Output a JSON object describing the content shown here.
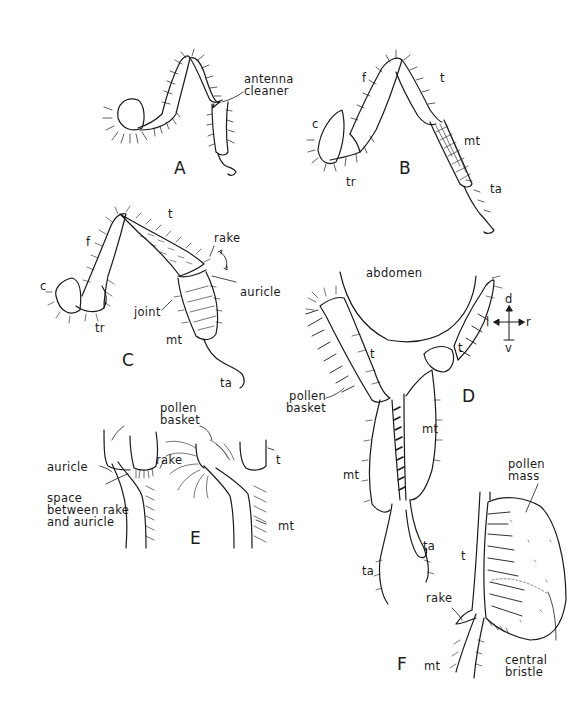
{
  "figure": {
    "panels": [
      {
        "id": "A",
        "letter": "A",
        "labels": [
          "antenna cleaner"
        ]
      },
      {
        "id": "B",
        "letter": "B",
        "labels": [
          "c",
          "f",
          "t",
          "tr",
          "mt",
          "ta"
        ]
      },
      {
        "id": "C",
        "letter": "C",
        "labels": [
          "c",
          "f",
          "t",
          "tr",
          "rake",
          "auricle",
          "joint",
          "mt",
          "ta"
        ]
      },
      {
        "id": "D",
        "letter": "D",
        "labels": [
          "abdomen",
          "t",
          "t",
          "pollen basket",
          "mt",
          "mt",
          "ta",
          "ta"
        ]
      },
      {
        "id": "E",
        "letter": "E",
        "labels": [
          "pollen basket",
          "auricle",
          "rake",
          "space between rake and auricle",
          "t",
          "mt"
        ]
      },
      {
        "id": "F",
        "letter": "F",
        "labels": [
          "pollen mass",
          "t",
          "rake",
          "central bristle",
          "mt"
        ]
      }
    ],
    "compass": {
      "up": "d",
      "down": "v",
      "left": "l",
      "right": "r"
    }
  },
  "A": {
    "letter": "A",
    "antenna_cleaner_1": "antenna",
    "antenna_cleaner_2": "cleaner"
  },
  "B": {
    "letter": "B",
    "c": "c",
    "f": "f",
    "t": "t",
    "tr": "tr",
    "mt": "mt",
    "ta": "ta"
  },
  "C": {
    "letter": "C",
    "c": "c",
    "f": "f",
    "t": "t",
    "tr": "tr",
    "rake": "rake",
    "auricle": "auricle",
    "joint": "joint",
    "mt": "mt",
    "ta": "ta"
  },
  "D": {
    "letter": "D",
    "abdomen": "abdomen",
    "t_left": "t",
    "t_right": "t",
    "pollen_basket_1": "pollen",
    "pollen_basket_2": "basket",
    "mt_right": "mt",
    "mt_left": "mt",
    "ta_right": "ta",
    "ta_left": "ta"
  },
  "E": {
    "letter": "E",
    "pollen_basket_1": "pollen",
    "pollen_basket_2": "basket",
    "auricle": "auricle",
    "rake": "rake",
    "space_1": "space",
    "space_2": "between rake",
    "space_3": "and auricle",
    "t": "t",
    "mt": "mt"
  },
  "F": {
    "letter": "F",
    "pollen_mass_1": "pollen",
    "pollen_mass_2": "mass",
    "t": "t",
    "rake": "rake",
    "central_bristle_1": "central",
    "central_bristle_2": "bristle",
    "mt": "mt"
  },
  "compass": {
    "d": "d",
    "v": "v",
    "l": "l",
    "r": "r"
  }
}
